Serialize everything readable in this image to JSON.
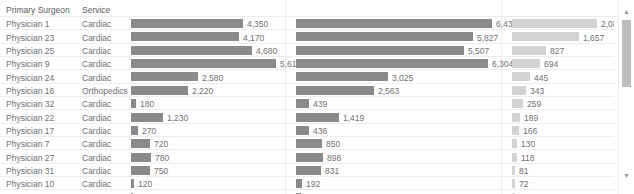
{
  "header": {
    "col_surgeon": "Primary Surgeon",
    "col_service": "Service"
  },
  "scrollbar": {
    "up_icon": "chevron-up-icon",
    "down_icon": "chevron-down-icon"
  },
  "chart_data": {
    "type": "bar",
    "title": "",
    "xlabel": "",
    "ylabel": "",
    "grid": true,
    "legend": "none",
    "orientation": "horizontal",
    "categories": [
      "Physician 1",
      "Physician 23",
      "Physician 25",
      "Physician 9",
      "Physician 24",
      "Physician 16",
      "Physician 32",
      "Physician 22",
      "Physician 17",
      "Physician 7",
      "Physician 27",
      "Physician 31",
      "Physician 10",
      "Physician 20"
    ],
    "service": [
      "Cardiac",
      "Cardiac",
      "Cardiac",
      "Cardiac",
      "Cardiac",
      "Orthopedics",
      "Cardiac",
      "Cardiac",
      "Cardiac",
      "Cardiac",
      "Cardiac",
      "Cardiac",
      "Cardiac",
      "Cardiac"
    ],
    "series": [
      {
        "name": "measure-1",
        "color": "#8a8a8a",
        "max": 5610,
        "values": [
          4350,
          4170,
          4680,
          5610,
          2580,
          2220,
          180,
          1230,
          270,
          720,
          780,
          750,
          120,
          60
        ],
        "labels": [
          "4,350",
          "4,170",
          "4,680",
          "5,610",
          "2,580",
          "2,220",
          "180",
          "1,230",
          "270",
          "720",
          "780",
          "750",
          "120",
          "60"
        ]
      },
      {
        "name": "measure-2",
        "color": "#8a8a8a",
        "max": 6437,
        "values": [
          6437,
          5827,
          5507,
          6304,
          3025,
          2563,
          439,
          1419,
          436,
          850,
          898,
          831,
          192,
          174
        ],
        "labels": [
          "6,437",
          "5,827",
          "5,507",
          "6,304",
          "3,025",
          "2,563",
          "439",
          "1,419",
          "436",
          "850",
          "898",
          "831",
          "192",
          "174"
        ]
      },
      {
        "name": "measure-3",
        "color": "#d3d3d3",
        "max": 2087,
        "values": [
          2087,
          1657,
          827,
          694,
          445,
          343,
          259,
          189,
          166,
          130,
          118,
          81,
          72,
          64
        ],
        "labels": [
          "2,087",
          "1,657",
          "827",
          "694",
          "445",
          "343",
          "259",
          "189",
          "166",
          "130",
          "118",
          "81",
          "72",
          "64"
        ]
      }
    ]
  }
}
